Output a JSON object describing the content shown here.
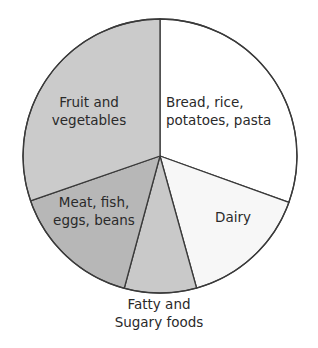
{
  "chart_data": {
    "type": "pie",
    "title": "",
    "start_angle_deg": 0,
    "direction": "clockwise",
    "slices": [
      {
        "label": "Bread, rice, potatoes, pasta",
        "lines": [
          "Bread, rice,",
          "potatoes, pasta"
        ],
        "value": 30.5,
        "color": "#ffffff",
        "label_pos": [
          166,
          107
        ],
        "anchor": "start"
      },
      {
        "label": "Dairy",
        "lines": [
          "Dairy"
        ],
        "value": 15.2,
        "color": "#f7f7f7",
        "label_pos": [
          233,
          222
        ],
        "anchor": "middle"
      },
      {
        "label": "Fatty and Sugary foods",
        "lines": [
          "Fatty and",
          "Sugary foods"
        ],
        "value": 8.5,
        "color": "#c9c9c9",
        "label_pos": [
          159,
          309
        ],
        "anchor": "middle"
      },
      {
        "label": "Meat, fish, eggs, beans",
        "lines": [
          "Meat, fish,",
          "eggs, beans"
        ],
        "value": 15.5,
        "color": "#b7b7b7",
        "label_pos": [
          94,
          207
        ],
        "anchor": "middle"
      },
      {
        "label": "Fruit and vegetables",
        "lines": [
          "Fruit and",
          "vegetables"
        ],
        "value": 30.3,
        "color": "#cbcbcb",
        "label_pos": [
          89,
          107
        ],
        "anchor": "middle"
      }
    ],
    "center": [
      160,
      156
    ],
    "radius": 137,
    "stroke": "#3a3a3a",
    "legend": "none"
  }
}
